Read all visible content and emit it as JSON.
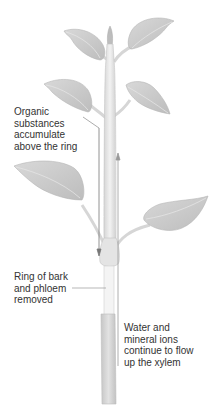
{
  "figure": {
    "type": "plant ringing experiment diagram",
    "labels": {
      "organic": {
        "lines": [
          "Organic",
          "substances",
          "accumulate",
          "above the ring"
        ]
      },
      "ring": {
        "lines": [
          "Ring of bark",
          "and phloem",
          "removed"
        ]
      },
      "water": {
        "lines": [
          "Water and",
          "mineral ions",
          "continue to flow",
          "up the xylem"
        ]
      }
    },
    "colors": {
      "leaf": "#c9c9c9",
      "leaf_vein": "#e4e4e4",
      "stem": "#e6e6e6",
      "stem_lower": "#d4d4d4",
      "line": "#888888",
      "text": "#333333"
    }
  }
}
